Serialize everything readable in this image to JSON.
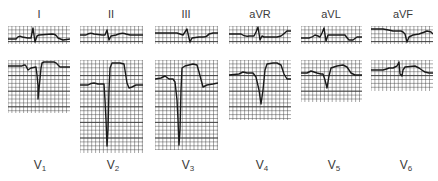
{
  "figure": {
    "limb_leads": [
      {
        "id": "I",
        "label": "I",
        "x": 8,
        "y": 26,
        "w": 62,
        "h": 18,
        "label_x": 39
      },
      {
        "id": "II",
        "label": "II",
        "x": 80,
        "y": 26,
        "w": 63,
        "h": 18,
        "label_x": 111
      },
      {
        "id": "III",
        "label": "III",
        "x": 155,
        "y": 26,
        "w": 63,
        "h": 18,
        "label_x": 186
      },
      {
        "id": "aVR",
        "label": "aVR",
        "x": 229,
        "y": 26,
        "w": 62,
        "h": 18,
        "label_x": 260
      },
      {
        "id": "aVL",
        "label": "aVL",
        "x": 301,
        "y": 26,
        "w": 61,
        "h": 18,
        "label_x": 331
      },
      {
        "id": "aVF",
        "label": "aVF",
        "x": 371,
        "y": 26,
        "w": 62,
        "h": 18,
        "label_x": 403
      }
    ],
    "precordial_leads": [
      {
        "id": "V1",
        "label": "V",
        "sub": "1",
        "x": 8,
        "y": 60,
        "w": 62,
        "h": 53,
        "label_x": 40
      },
      {
        "id": "V2",
        "label": "V",
        "sub": "2",
        "x": 80,
        "y": 60,
        "w": 63,
        "h": 93,
        "label_x": 113
      },
      {
        "id": "V3",
        "label": "V",
        "sub": "3",
        "x": 155,
        "y": 60,
        "w": 63,
        "h": 90,
        "label_x": 188
      },
      {
        "id": "V4",
        "label": "V",
        "sub": "4",
        "x": 229,
        "y": 60,
        "w": 62,
        "h": 60,
        "label_x": 262
      },
      {
        "id": "V5",
        "label": "V",
        "sub": "5",
        "x": 301,
        "y": 60,
        "w": 61,
        "h": 42,
        "label_x": 334
      },
      {
        "id": "V6",
        "label": "V",
        "sub": "6",
        "x": 371,
        "y": 60,
        "w": 62,
        "h": 31,
        "label_x": 406
      }
    ],
    "colors": {
      "grid": "#3c3c3c",
      "trace": "#1a1a1a",
      "label": "#3a3a3a",
      "background": "#ffffff"
    },
    "traces": {
      "I": "M0,13 L8,13 Q11,9 14,11 L20,12 L23,12 L25,2 L27,16 L29,10 L31,9 L44,8 Q48,8 50,12 L55,14 L62,13",
      "II": "M0,9 L6,9 Q10,6 14,8 L22,9 L25,9 L27,4 L29,14 L31,10 L36,9 Q42,6 46,8 L50,9 L63,9",
      "III": "M0,7 L22,7 L25,8 L28,9 L30,6 L32,3 L34,12 L35,16 L37,12 L44,11 L48,11 Q52,11 54,8 L58,7 L63,7",
      "aVR": "M0,8 L12,8 Q16,11 20,10 L25,10 L27,6 L29,1 L31,14 L33,10 L35,11 L48,11 L52,10 Q56,7 58,5 L62,5",
      "aVL": "M0,12 L8,12 Q12,11 14,9 L17,10 L19,11 L21,7 L23,2 L25,15 L27,9 L40,9 L44,9 Q46,12 48,14 L52,14 L56,11 L61,11",
      "aVF": "M0,3 L12,3 Q18,4 22,5 L30,5 L32,6 L34,8 L35,12 L36,16 L38,11 L42,9 L48,8 Q54,6 56,5 L60,6 L62,8",
      "V1": "M0,6 L14,6 Q17,4 18,6 L20,10 L23,8 L28,7 L29,15 L30,26 L30,39 L31,29 L32,19 L33,8 L34,3 L36,2 L46,2 Q49,3 50,5 L52,7 L62,7",
      "V2": "M0,25 L8,25 Q11,23 14,23 L18,24 L24,24 L25,40 L26,60 L27,86 L28,70 L29,30 L30,8 L32,3 L40,3 L44,4 L47,23 L49,28 L52,27 L56,25 L63,25",
      "V3": "M0,19 L6,18 L10,16 L14,19 L18,19 L20,22 L22,40 L23,60 L24,85 L25,70 L26,30 L27,8 L30,6 L38,4 L42,5 L44,12 L48,27 L52,25 L58,24 L63,23",
      "V4": "M0,15 L10,14 L14,12 L18,13 L24,13 L27,17 L30,30 L32,44 L34,30 L36,10 L38,4 L44,3 L48,3 L52,5 L55,14 L58,19 L62,19",
      "V5": "M0,13 L6,13 L10,11 L16,13 L20,14 L22,14 L24,20 L26,28 L28,16 L30,8 L36,6 L42,5 L46,7 L50,13 L54,15 L61,15",
      "V6": "M0,10 L12,10 Q16,9 18,8 L22,8 L24,7 L26,6 L28,2 L29,14 L31,16 L32,10 L34,7 L44,6 L48,8 Q52,11 54,12 L58,13 L62,13"
    }
  }
}
